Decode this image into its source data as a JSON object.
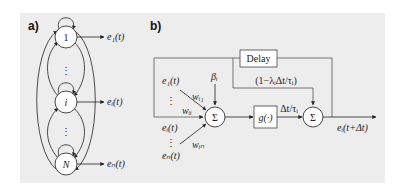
{
  "panel_a": {
    "tag": "a)",
    "nodes": [
      {
        "label": "1",
        "output": "e₁(t)"
      },
      {
        "label": "i",
        "output": "eᵢ(t)"
      },
      {
        "label": "N",
        "output": "eₙ(t)"
      }
    ],
    "ellipsis": "⋮"
  },
  "panel_b": {
    "tag": "b)",
    "delay_label": "Delay",
    "sum_symbol": "Σ",
    "g_label": "g(·)",
    "bias_label": "βᵢ",
    "inputs": [
      {
        "signal": "e₁(t)",
        "weight": "wᵢ₁"
      },
      {
        "signal": "eᵢ(t)",
        "weight": "wᵢᵢ"
      },
      {
        "signal": "eₙ(t)",
        "weight": "wᵢₙ"
      }
    ],
    "ellipsis": "⋮",
    "gain_label": "Δt/τᵢ",
    "decay_label": "(1−λᵢΔt/τᵢ)",
    "output_label": "eᵢ(t+Δt)"
  }
}
